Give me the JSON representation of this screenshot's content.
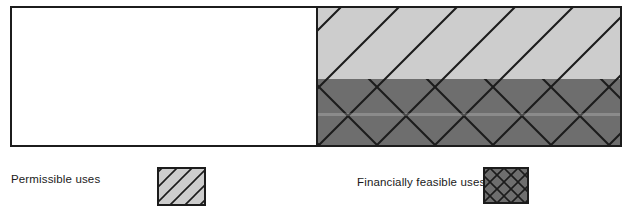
{
  "figure": {
    "type": "two-band-hatched-bar-diagram"
  },
  "main_box": {
    "name": "use-spectrum-bar",
    "x": 11,
    "y": 7,
    "width": 610,
    "height": 139,
    "border_color": "#1c1c1c",
    "border_width": 2,
    "segments": [
      {
        "name": "blank-segment",
        "fill": "#ffffff",
        "hatch": "none",
        "x": 11,
        "width": 306
      },
      {
        "name": "permissible-uses-band",
        "fill": "#cdcdcd",
        "hatch": "diagonal-up",
        "x": 317,
        "y": 7,
        "width": 304,
        "height": 72
      },
      {
        "name": "financially-feasible-uses-band",
        "fill": "#6e6e6e",
        "hatch": "cross-diamond",
        "x": 317,
        "y": 79,
        "width": 304,
        "height": 67
      }
    ],
    "divider_x": 317,
    "band_divider_y": 79
  },
  "hatching": {
    "line_color": "#1c1c1c",
    "line_width": 2,
    "spacing": 58,
    "angle_degrees": 45
  },
  "legend": {
    "items": [
      {
        "key": "permissible",
        "label": "Permissible uses",
        "swatch": {
          "name": "legend-swatch-permissible",
          "x": 158,
          "y": 168,
          "width": 47,
          "height": 37,
          "fill": "#cdcdcd",
          "hatch": "diagonal-up",
          "border_color": "#1c1c1c"
        }
      },
      {
        "key": "financially_feasible",
        "label": "Financially feasible uses",
        "swatch": {
          "name": "legend-swatch-financially-feasible",
          "x": 484,
          "y": 168,
          "width": 44,
          "height": 35,
          "fill": "#6e6e6e",
          "hatch": "cross-diamond",
          "border_color": "#1c1c1c"
        }
      }
    ]
  },
  "colors": {
    "background": "#ffffff",
    "light_band": "#cdcdcd",
    "dark_band": "#6e6e6e",
    "ink": "#1c1c1c",
    "text": "#1a1a1a"
  }
}
